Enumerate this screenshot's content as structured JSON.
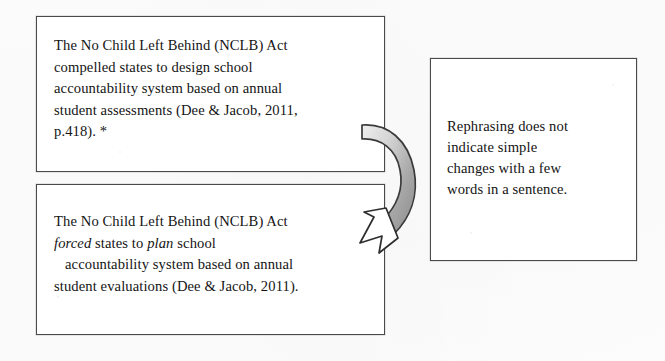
{
  "document": {
    "type": "paraphrasing-example-diagram",
    "background_color": "#fdfdfd",
    "text_color": "#141414",
    "border_color": "#4a4a4a"
  },
  "source_box": {
    "name": "original-quotation",
    "lines": [
      "The No Child Left Behind (NCLB) Act",
      "compelled states to design school",
      "accountability system based on annual",
      "student assessments (Dee & Jacob, 2011,",
      "p.418). *"
    ],
    "line1": "The No Child Left Behind (NCLB) Act",
    "line2": "compelled states to design school",
    "line3": "accountability system based on annual",
    "line4": "student assessments (Dee & Jacob, 2011,",
    "line5": "p.418). *",
    "citation": "(Dee & Jacob, 2011, p.418)",
    "marker": "*"
  },
  "paraphrase_box": {
    "name": "attempted-paraphrase",
    "line1": "The No Child Left Behind (NCLB) Act",
    "line2_italic_1": "forced",
    "line2_mid": " states to ",
    "line2_italic_2": "plan",
    "line2_end": " school",
    "line3": "accountability system based on annual",
    "line4": "student evaluations (Dee & Jacob, 2011).",
    "citation": "(Dee & Jacob, 2011)"
  },
  "comment_box": {
    "name": "evaluation-comment",
    "line1": "Rephrasing does not",
    "line2": "indicate simple",
    "line3": "changes with a few",
    "line4": "words in a sentence."
  },
  "arrow": {
    "name": "curved-transform-arrow",
    "direction": "from source box down-left into paraphrase box",
    "fill_light": "#e6e6e6",
    "fill_dark": "#9a9a9a",
    "stroke": "#333333"
  }
}
